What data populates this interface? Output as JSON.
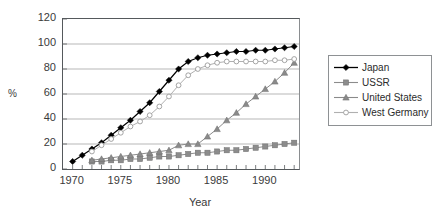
{
  "chart_data": {
    "type": "line",
    "title": "",
    "xlabel": "Year",
    "ylabel": "%",
    "xlim": [
      1969,
      1993.5
    ],
    "ylim": [
      0,
      120
    ],
    "ytick_values": [
      0,
      20,
      40,
      60,
      80,
      100,
      120
    ],
    "xtick_values": [
      1970,
      1975,
      1980,
      1985,
      1990
    ],
    "xtick_labels": [
      "1970",
      "1975",
      "1980",
      "1985",
      "1990"
    ],
    "ytick_labels": [
      "0",
      "20",
      "40",
      "60",
      "80",
      "100",
      "120"
    ],
    "x_minor_tick_interval": 1,
    "grid": "horizontal",
    "legend_position": "right-outside",
    "x": [
      1970,
      1971,
      1972,
      1973,
      1974,
      1975,
      1976,
      1977,
      1978,
      1979,
      1980,
      1981,
      1982,
      1983,
      1984,
      1985,
      1986,
      1987,
      1988,
      1989,
      1990,
      1991,
      1992,
      1993
    ],
    "series": [
      {
        "name": "Japan",
        "marker": "filled-diamond",
        "color": "#000000",
        "values": [
          6,
          11,
          16,
          21,
          27,
          33,
          39,
          46,
          53,
          62,
          71,
          80,
          86,
          89,
          91,
          92,
          93,
          94,
          94,
          95,
          95,
          96,
          97,
          98
        ]
      },
      {
        "name": "USSR",
        "marker": "filled-square",
        "color": "#8c8c8c",
        "values": [
          null,
          null,
          6,
          6,
          7,
          7,
          8,
          8,
          9,
          10,
          10,
          11,
          12,
          13,
          13,
          14,
          15,
          15,
          16,
          17,
          18,
          19,
          20,
          21
        ]
      },
      {
        "name": "United States",
        "marker": "filled-triangle",
        "color": "#8a8a8a",
        "values": [
          null,
          null,
          7,
          8,
          9,
          10,
          11,
          12,
          13,
          14,
          15,
          19,
          20,
          20,
          26,
          32,
          39,
          45,
          52,
          58,
          64,
          70,
          77,
          85
        ]
      },
      {
        "name": "West Germany",
        "marker": "open-circle",
        "color": "#b0b0b0",
        "values": [
          null,
          null,
          14,
          19,
          24,
          29,
          34,
          38,
          43,
          50,
          58,
          67,
          75,
          80,
          83,
          85,
          86,
          86,
          86,
          86,
          86,
          87,
          87,
          88
        ]
      }
    ]
  },
  "axis": {
    "ylabel": "%",
    "xtitle": "Year"
  },
  "legend": {
    "items": [
      {
        "label": "Japan",
        "symbol": "filled-diamond-icon"
      },
      {
        "label": "USSR",
        "symbol": "filled-square-icon"
      },
      {
        "label": "United States",
        "symbol": "filled-triangle-icon"
      },
      {
        "label": "West Germany",
        "symbol": "open-circle-icon"
      }
    ]
  }
}
